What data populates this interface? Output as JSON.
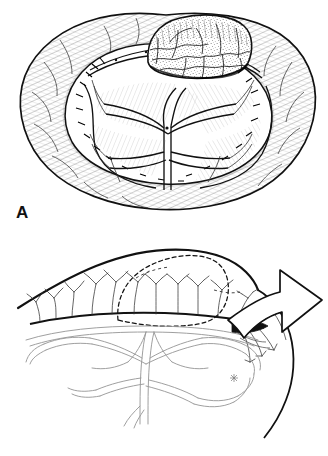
{
  "figure": {
    "kind": "medical-line-illustration",
    "background_color": "#ffffff",
    "ink_color": "#111111",
    "vessel_color": "#8f8f8f",
    "hatch_color": "#333333",
    "width": 328,
    "height": 456,
    "panel_count": 2
  },
  "panels": [
    {
      "id": "A",
      "label": "A",
      "view": "en face view of opened bowel loop with exophytic tumor and fan-shaped mesentery",
      "structures": [
        {
          "name": "bowel-loop",
          "description": "horseshoe-shaped intestinal loop with serosal hatching"
        },
        {
          "name": "tumor-mass",
          "description": "stippled nodular tumor on antimesenteric bowel wall"
        },
        {
          "name": "mesentery",
          "description": "fan of mesenteric leaves between vascular arcades"
        },
        {
          "name": "vascular-arcade",
          "description": "branching arterial arcades within mesentery"
        },
        {
          "name": "marginal-artery",
          "description": "artery running along mesenteric border of bowel"
        }
      ]
    },
    {
      "id": "B",
      "label": "B",
      "view": "lateral view showing tumor in dashed outline and mesentery being elevated",
      "structures": [
        {
          "name": "bowel-wall",
          "description": "bold line of bowel wall in profile"
        },
        {
          "name": "tumor-outline",
          "description": "dashed outline of intramural tumor"
        },
        {
          "name": "vasa-recta",
          "description": "fine straight branching vessels to bowel wall"
        },
        {
          "name": "mesenteric-vessel-tree",
          "description": "grey double-line arterial arcade tree"
        },
        {
          "name": "traction-arrow",
          "description": "large hollow curved arrow indicating retraction direction"
        },
        {
          "name": "vessel-marker",
          "description": "small asterisk marking a named vessel"
        }
      ]
    }
  ]
}
